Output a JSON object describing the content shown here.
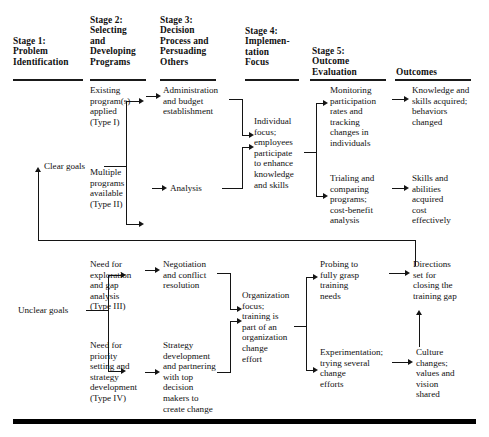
{
  "diagram": {
    "columns": [
      {
        "id": "stage1",
        "label": "Stage 1:\nProblem\nIdentification"
      },
      {
        "id": "stage2",
        "label": "Stage 2:\nSelecting\nand\nDeveloping\nPrograms"
      },
      {
        "id": "stage3",
        "label": "Stage 3:\nDecision\nProcess and\nPersuading\nOthers"
      },
      {
        "id": "stage4",
        "label": "Stage 4:\nImplemen-\ntation\nFocus"
      },
      {
        "id": "stage5",
        "label": "Stage 5:\nOutcome\nEvaluation"
      },
      {
        "id": "outcomes",
        "label": "Outcomes"
      }
    ],
    "goals": {
      "clear": "Clear goals",
      "unclear": "Unclear goals"
    },
    "nodes": {
      "type1": "Existing\nprogram(s)\napplied\n(Type I)",
      "type2": "Multiple\nprograms\navailable\n(Type II)",
      "type3": "Need for\nexploration\nand gap\nanalysis\n(Type III)",
      "type4": "Need for\npriority\nsetting and\nstrategy\ndevelopment\n(Type IV)",
      "admin": "Administration\nand budget\nestablishment",
      "analysis": "Analysis",
      "negotiation": "Negotiation\nand conflict\nresolution",
      "strategy": "Strategy\ndevelopment\nand partnering\nwith top\ndecision\nmakers to\ncreate change",
      "individual_focus": "Individual\nfocus;\nemployees\nparticipate\nto enhance\nknowledge\nand skills",
      "organization_focus": "Organization\nfocus;\ntraining is\npart of an\norganization\nchange\neffort",
      "monitoring": "Monitoring\nparticipation\nrates and\ntracking\nchanges in\nindividuals",
      "trialing": "Trialing and\ncomparing\nprograms;\ncost-benefit\nanalysis",
      "probing": "Probing to\nfully grasp\ntraining\nneeds",
      "experimentation": "Experimentation;\ntrying several\nchange\nefforts",
      "knowledge": "Knowledge and\nskills acquired;\nbehaviors\nchanged",
      "skills_abilities": "Skills and\nabilities\nacquired\ncost\neffectively",
      "directions": "Directions\nset for\nclosing the\ntraining gap",
      "culture": "Culture\nchanges;\nvalues and\nvision\nshared"
    },
    "colors": {
      "ink": "#101010",
      "rule": "#141414",
      "frame": "#000000",
      "background": "#ffffff"
    }
  }
}
